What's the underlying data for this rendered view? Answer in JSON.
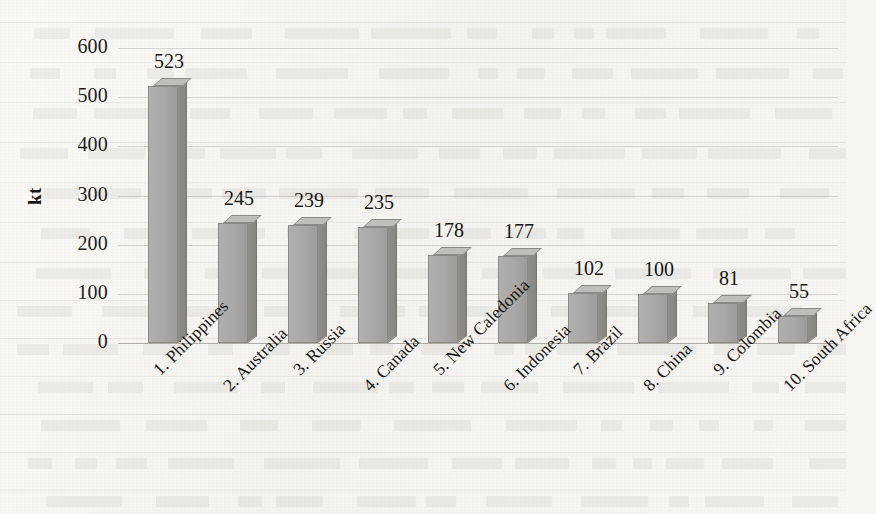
{
  "chart_data": {
    "type": "bar",
    "title": "",
    "subtitle": "",
    "xlabel": "",
    "ylabel": "kt",
    "ylim": [
      0,
      600
    ],
    "ytick_step": 100,
    "yticks": [
      "600",
      "500",
      "400",
      "300",
      "200",
      "100",
      "0"
    ],
    "grid": true,
    "legend": "none",
    "three_d": true,
    "categories": [
      "1. Philippines",
      "2. Australia",
      "3. Russia",
      "4. Canada",
      "5. New Caledonia",
      "6. Indonesia",
      "7. Brazil",
      "8. China",
      "9. Colombia",
      "10. South Africa"
    ],
    "values": [
      523,
      245,
      239,
      235,
      178,
      177,
      102,
      100,
      81,
      55
    ],
    "value_labels": [
      "523",
      "245",
      "239",
      "235",
      "178",
      "177",
      "102",
      "100",
      "81",
      "55"
    ]
  },
  "style": {
    "page_background": "#f6f5f2",
    "bar_front": "#a9a8a6",
    "bar_top": "#bfbebb",
    "bar_side": "#8b8a85",
    "bar_outline": "#8b8a87",
    "text_color": "#171614",
    "gridline_color": "#969189"
  }
}
